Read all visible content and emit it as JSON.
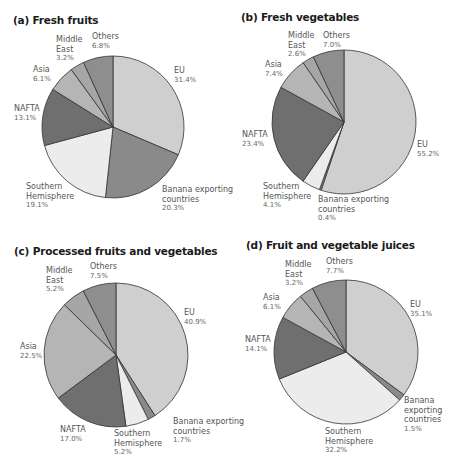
{
  "chart_data": [
    {
      "type": "pie",
      "title": "(a) Fresh fruits",
      "categories": [
        "EU",
        "Banana exporting countries",
        "Southern Hemisphere",
        "NAFTA",
        "Asia",
        "Middle East",
        "Others"
      ],
      "values": [
        31.4,
        20.3,
        19.1,
        13.1,
        6.1,
        3.2,
        6.8
      ],
      "labels": [
        "31.4%",
        "20.3%",
        "19.1%",
        "13.1%",
        "6.1%",
        "3.2%",
        "6.8%"
      ]
    },
    {
      "type": "pie",
      "title": "(b) Fresh vegetables",
      "categories": [
        "EU",
        "Banana exporting countries",
        "Southern Hemisphere",
        "NAFTA",
        "Asia",
        "Middle East",
        "Others"
      ],
      "values": [
        55.2,
        0.4,
        4.1,
        23.4,
        7.4,
        2.6,
        7.0
      ],
      "labels": [
        "55.2%",
        "0.4%",
        "4.1%",
        "23.4%",
        "7.4%",
        "2.6%",
        "7.0%"
      ]
    },
    {
      "type": "pie",
      "title": "(c) Processed fruits and vegetables",
      "categories": [
        "EU",
        "Banana exporting countries",
        "Southern Hemisphere",
        "NAFTA",
        "Asia",
        "Middle East",
        "Others"
      ],
      "values": [
        40.9,
        1.7,
        5.2,
        17.0,
        22.5,
        5.2,
        7.5
      ],
      "labels": [
        "40.9%",
        "1.7%",
        "5.2%",
        "17.0%",
        "22.5%",
        "5.2%",
        "7.5%"
      ]
    },
    {
      "type": "pie",
      "title": "(d) Fruit and vegetable juices",
      "categories": [
        "EU",
        "Banana exporting countries",
        "Southern Hemisphere",
        "NAFTA",
        "Asia",
        "Middle East",
        "Others"
      ],
      "values": [
        35.1,
        1.5,
        32.2,
        14.1,
        6.1,
        3.2,
        7.7
      ],
      "labels": [
        "35.1%",
        "1.5%",
        "32.2%",
        "14.1%",
        "6.1%",
        "3.2%",
        "7.7%"
      ]
    }
  ],
  "colors": {
    "EU": "#cfcfcf",
    "Banana exporting countries": "#8a8a8a",
    "Southern Hemisphere": "#ececec",
    "NAFTA": "#6f6f6f",
    "Asia": "#b5b5b5",
    "Middle East": "#a6a6a6",
    "Others": "#8e8e8e"
  },
  "panels": [
    {
      "title": "(a) Fresh fruits",
      "labels": {
        "eu": {
          "name": "EU",
          "value": "31.4%"
        },
        "banana": {
          "name1": "Banana exporting",
          "name2": "countries",
          "value": "20.3%"
        },
        "southern": {
          "name1": "Southern",
          "name2": "Hemisphere",
          "value": "19.1%"
        },
        "nafta": {
          "name": "NAFTA",
          "value": "13.1%"
        },
        "asia": {
          "name": "Asia",
          "value": "6.1%"
        },
        "middle_east": {
          "name1": "Middle",
          "name2": "East",
          "value": "3.2%"
        },
        "others": {
          "name": "Others",
          "value": "6.8%"
        }
      }
    },
    {
      "title": "(b) Fresh vegetables",
      "labels": {
        "eu": {
          "name": "EU",
          "value": "55.2%"
        },
        "banana": {
          "name1": "Banana exporting",
          "name2": "countries",
          "value": "0.4%"
        },
        "southern": {
          "name1": "Southern",
          "name2": "Hemisphere",
          "value": "4.1%"
        },
        "nafta": {
          "name": "NAFTA",
          "value": "23.4%"
        },
        "asia": {
          "name": "Asia",
          "value": "7.4%"
        },
        "middle_east": {
          "name1": "Middle",
          "name2": "East",
          "value": "2.6%"
        },
        "others": {
          "name": "Others",
          "value": "7.0%"
        }
      }
    },
    {
      "title": "(c) Processed fruits and vegetables",
      "labels": {
        "eu": {
          "name": "EU",
          "value": "40.9%"
        },
        "banana": {
          "name1": "Banana exporting",
          "name2": "countries",
          "value": "1.7%"
        },
        "southern": {
          "name1": "Southern",
          "name2": "Hemisphere",
          "value": "5.2%"
        },
        "nafta": {
          "name": "NAFTA",
          "value": "17.0%"
        },
        "asia": {
          "name": "Asia",
          "value": "22.5%"
        },
        "middle_east": {
          "name1": "Middle",
          "name2": "East",
          "value": "5.2%"
        },
        "others": {
          "name": "Others",
          "value": "7.5%"
        }
      }
    },
    {
      "title": "(d) Fruit and vegetable juices",
      "labels": {
        "eu": {
          "name": "EU",
          "value": "35.1%"
        },
        "banana": {
          "name1": "Banana",
          "name2": "exporting",
          "name3": "countries",
          "value": "1.5%"
        },
        "southern": {
          "name1": "Southern",
          "name2": "Hemisphere",
          "value": "32.2%"
        },
        "nafta": {
          "name": "NAFTA",
          "value": "14.1%"
        },
        "asia": {
          "name": "Asia",
          "value": "6.1%"
        },
        "middle_east": {
          "name1": "Middle",
          "name2": "East",
          "value": "3.2%"
        },
        "others": {
          "name": "Others",
          "value": "7.7%"
        }
      }
    }
  ]
}
